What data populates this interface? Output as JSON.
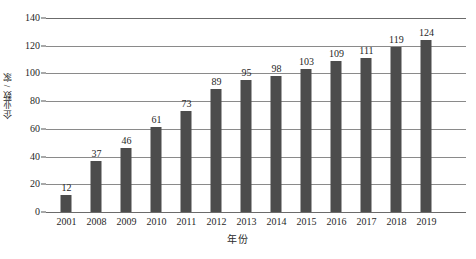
{
  "chart_data": {
    "type": "bar",
    "title": "",
    "xlabel": "年份",
    "ylabel": "企业数 / 家",
    "categories": [
      "2001",
      "2008",
      "2009",
      "2010",
      "2011",
      "2012",
      "2013",
      "2014",
      "2015",
      "2016",
      "2017",
      "2018",
      "2019"
    ],
    "values": [
      12,
      37,
      46,
      61,
      73,
      89,
      95,
      98,
      103,
      109,
      111,
      119,
      124
    ],
    "ylim": [
      0,
      140
    ],
    "ytick_labels": [
      "0",
      "20",
      "40",
      "60",
      "80",
      "100",
      "120",
      "140"
    ],
    "ytick_values": [
      0,
      20,
      40,
      60,
      80,
      100,
      120,
      140
    ],
    "grid": true,
    "legend": "none",
    "bar_color": "#4c4c4c",
    "gridline_color": "#8a8a8a",
    "axis_color": "#6b6b6b",
    "text_color": "#1f1f1f",
    "data_labels_shown": true
  }
}
